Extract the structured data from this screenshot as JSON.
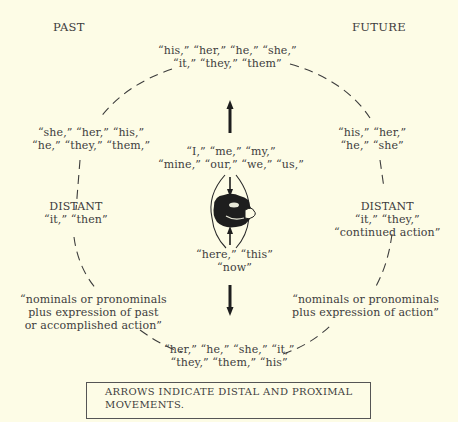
{
  "headers": {
    "past": "PAST",
    "future": "FUTURE"
  },
  "top": {
    "line1": "“his,” “her,” “he,” “she,”",
    "line2": "“it,” “they,” “them”"
  },
  "upper_left": {
    "line1": "“she,” “her,” “his,”",
    "line2": "“he,” “they,” “them,”"
  },
  "upper_right": {
    "line1": "“his,” “her,”",
    "line2": "“he,” “she”"
  },
  "center_top": {
    "line1": "“I,” “me,” “my,”",
    "line2": "“mine,” “our,” “we,” “us,”"
  },
  "center_bottom": {
    "line1": "“here,” “this”",
    "line2": "“now”"
  },
  "left_distant": {
    "title": "DISTANT",
    "line1": "“it,” “then”"
  },
  "right_distant": {
    "title": "DISTANT",
    "line1": "“it,” “they,”",
    "line2": "“continued action”"
  },
  "lower_left": {
    "line1": "“nominals or pronominals",
    "line2": "plus expression of past",
    "line3": "or accomplished action”"
  },
  "lower_right": {
    "line1": "“nominals or pronominals",
    "line2": "plus expression of action”"
  },
  "bottom": {
    "line1": "“her,” “he,” “she,” “it,”",
    "line2": "“they,” “them,” “his”"
  },
  "legend": {
    "line1": "ARROWS INDICATE DISTAL AND PROXIMAL",
    "line2": "MOVEMENTS."
  },
  "icons": {
    "center": "person-globe-icon",
    "arrows": [
      "up-arrow-icon",
      "down-arrow-icon",
      "inward-arrow-top-icon",
      "inward-arrow-bottom-icon"
    ]
  },
  "colors": {
    "background": "#fdfce6",
    "ink": "#3d3d3d",
    "dark": "#1e1e1e"
  }
}
